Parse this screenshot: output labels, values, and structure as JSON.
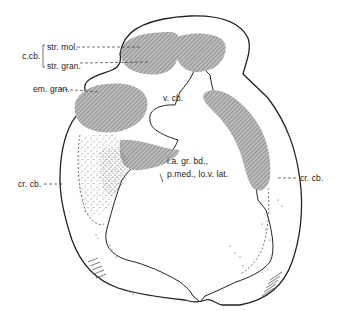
{
  "figure": {
    "type": "anatomical-section",
    "colors": {
      "outline": "#222222",
      "shading": "#9a9a9a",
      "background": "#ffffff"
    }
  },
  "labels": {
    "c_cb": "c.cb.",
    "str_mol": "str. mol.",
    "str_gran": "str. gran.",
    "em_gran": "em. gran.",
    "v_cb": "v. cb.",
    "cr_cb_left": "cr. cb.",
    "cr_cb_right": "cr. cb.",
    "i_a_gr_bd_line1": "i.a. gr. bd.,",
    "i_a_gr_bd_line2": "p.med., lo.v. lat."
  }
}
